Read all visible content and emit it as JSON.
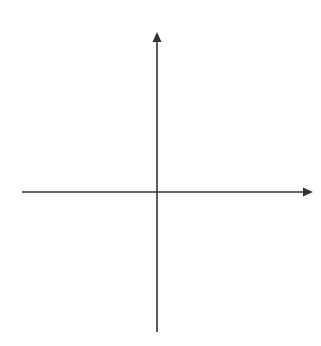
{
  "diagram": {
    "type": "cartesian-coordinate-plane",
    "x_axis": {
      "label": "x",
      "range": [
        -6,
        6
      ],
      "ticks": [
        -5,
        -4,
        -3,
        -2,
        -1,
        1,
        2,
        3,
        4,
        5
      ],
      "tick_labels": [
        "−5",
        "−4",
        "−3",
        "−2",
        "−1",
        "1",
        "2",
        "3",
        "4",
        "5"
      ]
    },
    "y_axis": {
      "label": "y",
      "range": [
        -6,
        6
      ],
      "ticks": [
        5,
        4,
        3,
        2,
        1,
        -1,
        -2,
        -3,
        -4,
        -5
      ],
      "tick_labels": [
        "5",
        "4",
        "3",
        "2",
        "1",
        "−1",
        "−2",
        "−3",
        "−4",
        "−5"
      ]
    },
    "grid": {
      "on": true,
      "style": "dotted",
      "spacing": 1
    },
    "colors": {
      "axis": "#333333",
      "grid": "#bbbbbb"
    }
  }
}
